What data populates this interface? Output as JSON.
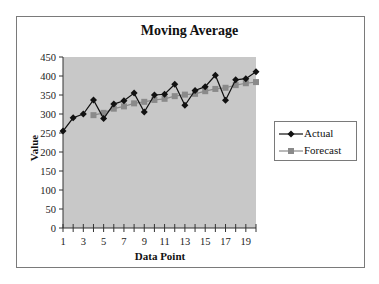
{
  "chart_data": {
    "type": "line",
    "title": "Moving Average",
    "xlabel": "Data Point",
    "ylabel": "Value",
    "x": [
      1,
      2,
      3,
      4,
      5,
      6,
      7,
      8,
      9,
      10,
      11,
      12,
      13,
      14,
      15,
      16,
      17,
      18,
      19,
      20
    ],
    "x_tick_labels": [
      "1",
      "3",
      "5",
      "7",
      "9",
      "11",
      "13",
      "15",
      "17",
      "19"
    ],
    "y_tick_labels": [
      "0",
      "50",
      "100",
      "150",
      "200",
      "250",
      "300",
      "350",
      "400",
      "450"
    ],
    "ylim": [
      0,
      450
    ],
    "xlim": [
      1,
      20
    ],
    "grid": false,
    "legend_position": "right",
    "plot_background": "#c8c8c8",
    "series": [
      {
        "name": "Actual",
        "color": "#111111",
        "marker": "diamond",
        "values": [
          255,
          290,
          300,
          337,
          288,
          326,
          335,
          355,
          305,
          350,
          352,
          378,
          323,
          362,
          372,
          402,
          336,
          390,
          393,
          411
        ]
      },
      {
        "name": "Forecast",
        "color": "#8a8a8a",
        "marker": "square",
        "values": [
          null,
          null,
          null,
          297,
          303,
          314,
          320,
          328,
          332,
          337,
          340,
          347,
          351,
          353,
          360,
          366,
          369,
          376,
          381,
          384
        ]
      }
    ]
  }
}
